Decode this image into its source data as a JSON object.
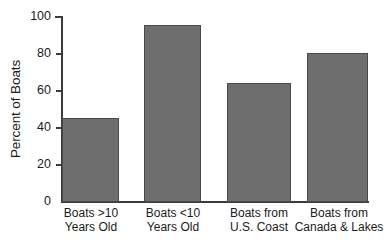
{
  "chart_data": {
    "type": "bar",
    "title": "",
    "subtitle": "",
    "xlabel": "",
    "ylabel": "Percent of Boats",
    "categories": [
      "Boats >10 Years Old",
      "Boats <10 Years Old",
      "Boats from U.S. Coast",
      "Boats from Canada & Lakes"
    ],
    "category_lines": [
      [
        "Boats >10",
        "Years Old"
      ],
      [
        "Boats <10",
        "Years Old"
      ],
      [
        "Boats from",
        "U.S. Coast"
      ],
      [
        "Boats from",
        "Canada & Lakes"
      ]
    ],
    "values": [
      45,
      95,
      64,
      80
    ],
    "ylim": [
      0,
      100
    ],
    "yticks": [
      0,
      20,
      40,
      60,
      80,
      100
    ],
    "ytick_labels": [
      "0",
      "20",
      "40",
      "60",
      "80",
      "100"
    ],
    "grid": false,
    "legend": false,
    "legend_position": "none",
    "bar_color": "#6e6e6e",
    "bar_edge_color": "#4a4a4a",
    "axis_color": "#3b3b3b",
    "background_color": "#ffffff",
    "text_color": "#1a1a1a"
  }
}
